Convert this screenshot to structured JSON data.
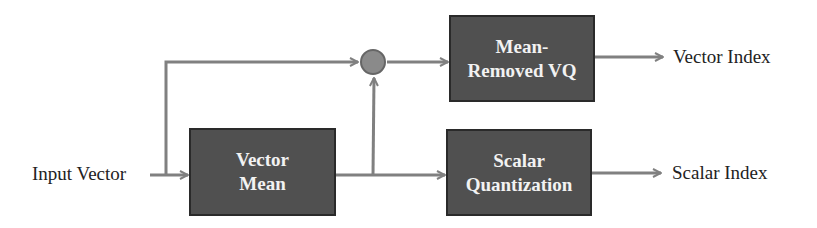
{
  "diagram": {
    "input_label": "Input Vector",
    "blocks": {
      "vector_mean": {
        "line1": "Vector",
        "line2": "Mean"
      },
      "mean_removed_vq": {
        "line1": "Mean-",
        "line2": "Removed VQ"
      },
      "scalar_quantization": {
        "line1": "Scalar",
        "line2": "Quantization"
      }
    },
    "outputs": {
      "vector_index": "Vector Index",
      "scalar_index": "Scalar Index"
    },
    "summing_node": "subtraction-junction",
    "colors": {
      "block_fill": "#505050",
      "line": "#808080",
      "node_fill": "#8a8a8a"
    }
  }
}
